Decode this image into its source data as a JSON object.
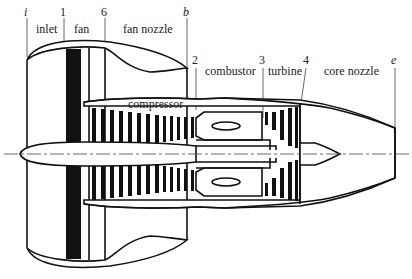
{
  "stations": [
    {
      "id": "i",
      "x": 27
    },
    {
      "id": "1",
      "x": 64
    },
    {
      "id": "6",
      "x": 105
    },
    {
      "id": "b",
      "x": 187
    },
    {
      "id": "2",
      "x": 196
    },
    {
      "id": "3",
      "x": 263
    },
    {
      "id": "4",
      "x": 305
    },
    {
      "id": "e",
      "x": 395
    }
  ],
  "station_labels": {
    "i": "i",
    "s1": "1",
    "s6": "6",
    "b": "b",
    "s2": "2",
    "s3": "3",
    "s4": "4",
    "e": "e"
  },
  "components": {
    "inlet": "inlet",
    "fan": "fan",
    "fan_nozzle": "fan nozzle",
    "compressor": "compressor",
    "combustor": "combustor",
    "turbine": "turbine",
    "core_nozzle": "core nozzle"
  },
  "colors": {
    "line": "#111111",
    "background": "#ffffff"
  }
}
